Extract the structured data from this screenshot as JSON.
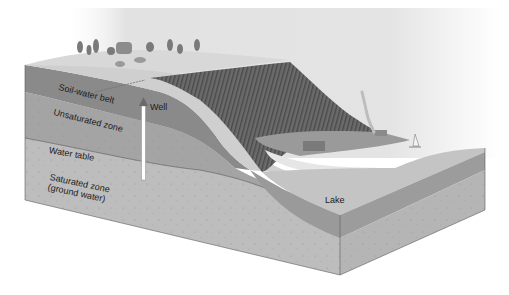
{
  "diagram": {
    "style": "grayscale illustration",
    "labels": {
      "soil_water_belt": "Soil-water belt",
      "well": "Well",
      "unsaturated_zone": "Unsaturated zone",
      "water_table": "Water table",
      "saturated_zone_line1": "Saturated zone",
      "saturated_zone_line2": "(ground water)",
      "lake": "Lake"
    },
    "features": [
      "hilltop with trees",
      "cliff/escarpment",
      "well",
      "town by the lake",
      "smoke plume",
      "sailboat",
      "lake"
    ],
    "colors": {
      "sky": "#e6e6e6",
      "soil_belt": "#8a8a8a",
      "unsaturated": "#a6a6a6",
      "saturated": "#bdbdbd",
      "lake_surface": "#c4c4c4",
      "lake_water": "#9a9a9a",
      "cliff": "#6a6a6a",
      "hilltop": "#d2d2d2",
      "well_pipe": "#ffffff"
    }
  }
}
